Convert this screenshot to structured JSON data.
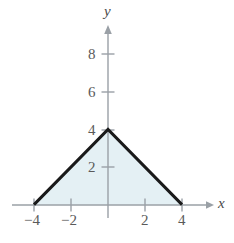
{
  "chart_data": {
    "type": "area",
    "title": "",
    "subtitle": "",
    "xlabel": "x",
    "ylabel": "y",
    "xlim": [
      -5.2,
      5.6
    ],
    "ylim": [
      -1.2,
      9.6
    ],
    "grid": false,
    "legend": null,
    "x_ticks": [
      -4,
      -2,
      2,
      4
    ],
    "x_tick_labels": [
      "−4",
      "−2",
      "2",
      "4"
    ],
    "y_ticks": [
      2,
      4,
      6,
      8
    ],
    "y_tick_labels": [
      "2",
      "4",
      "6",
      "8"
    ],
    "series": [
      {
        "name": "y = 4 - |x|",
        "type": "line",
        "filled": true,
        "x": [
          -4,
          0,
          4
        ],
        "values": [
          0,
          4,
          0
        ],
        "line_color": "#1a1a1a",
        "line_width": 3,
        "fill_color": "#e4f0f4"
      }
    ],
    "annotations": [],
    "colors": {
      "axis": "#9aa0a6",
      "curve": "#1a1a1a",
      "fill": "#e4f0f4",
      "tick_text": "#5a5a5a",
      "axis_label_text": "#4a4a4a",
      "background": "#ffffff"
    }
  },
  "axes": {
    "x_axis_name": "x",
    "y_axis_name": "y"
  },
  "ticks": {
    "x": [
      {
        "value": -4,
        "label": "−4",
        "px": 34
      },
      {
        "value": -2,
        "label": "−2",
        "px": 71
      },
      {
        "value": 2,
        "label": "2",
        "px": 145
      },
      {
        "value": 4,
        "label": "4",
        "px": 182
      }
    ],
    "y": [
      {
        "value": 2,
        "label": "2",
        "px": 167
      },
      {
        "value": 4,
        "label": "4",
        "px": 130
      },
      {
        "value": 6,
        "label": "6",
        "px": 92
      },
      {
        "value": 8,
        "label": "8",
        "px": 54
      }
    ]
  }
}
